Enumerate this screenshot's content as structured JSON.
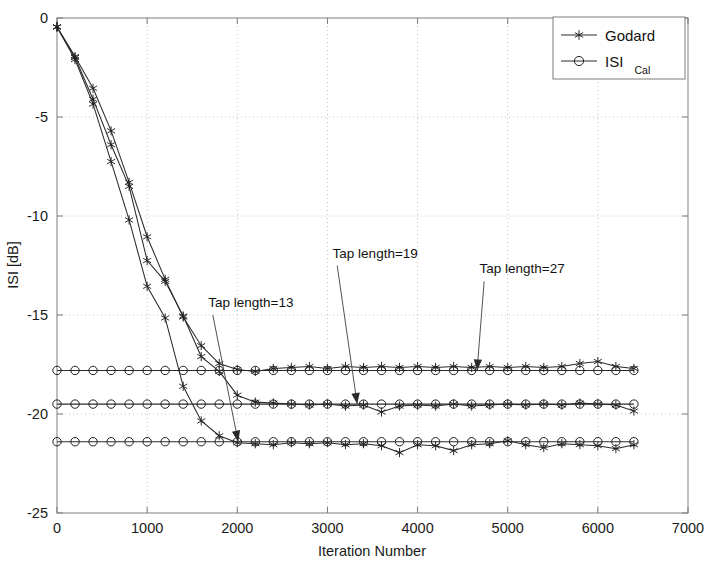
{
  "chart_data": {
    "type": "line",
    "title": "",
    "xlabel": "Iteration Number",
    "ylabel": "ISI [dB]",
    "xlim": [
      0,
      7000
    ],
    "ylim": [
      -25,
      0
    ],
    "xticks": [
      0,
      1000,
      2000,
      3000,
      4000,
      5000,
      6000,
      7000
    ],
    "yticks": [
      0,
      -5,
      -10,
      -15,
      -20,
      -25
    ],
    "xtick_labels": [
      "0",
      "1000",
      "2000",
      "3000",
      "4000",
      "5000",
      "6000",
      "7000"
    ],
    "ytick_labels": [
      "0",
      "-5",
      "-10",
      "-15",
      "-20",
      "-25"
    ],
    "grid": true,
    "grid_style": "dotted",
    "legend": {
      "position": "top-right",
      "entries": [
        {
          "label": "Godard",
          "marker": "star",
          "line": "solid"
        },
        {
          "label": "ISI",
          "sublabel": "Cal",
          "marker": "circle",
          "line": "solid"
        }
      ]
    },
    "annotations": [
      {
        "text": "Tap length=13",
        "text_x": 2150,
        "text_y": -14.6,
        "target_x": 2010,
        "target_y": -21.4
      },
      {
        "text": "Tap length=19",
        "text_x": 3530,
        "text_y": -12.1,
        "target_x": 3330,
        "target_y": -19.5
      },
      {
        "text": "Tap length=27",
        "text_x": 5160,
        "text_y": -12.9,
        "target_x": 4660,
        "target_y": -17.8
      }
    ],
    "marker_interval": 200,
    "series": [
      {
        "name": "Godard, Tap length=13",
        "marker": "star",
        "x": [
          0,
          200,
          400,
          600,
          800,
          1000,
          1200,
          1400,
          1600,
          1800,
          2000,
          2200,
          2400,
          2600,
          2800,
          3000,
          3200,
          3400,
          3600,
          3800,
          4000,
          4200,
          4400,
          4600,
          4800,
          5000,
          5200,
          5400,
          5600,
          5800,
          6000,
          6200,
          6400
        ],
        "values": [
          -0.45,
          -2.1,
          -4.35,
          -7.25,
          -10.2,
          -13.55,
          -15.15,
          -18.6,
          -20.35,
          -21.1,
          -21.45,
          -21.5,
          -21.55,
          -21.45,
          -21.5,
          -21.45,
          -21.55,
          -21.5,
          -21.6,
          -21.95,
          -21.55,
          -21.6,
          -21.85,
          -21.55,
          -21.5,
          -21.35,
          -21.55,
          -21.7,
          -21.5,
          -21.55,
          -21.6,
          -21.75,
          -21.55
        ]
      },
      {
        "name": "Godard, Tap length=19",
        "marker": "star",
        "x": [
          0,
          200,
          400,
          600,
          800,
          1000,
          1200,
          1400,
          1600,
          1800,
          2000,
          2200,
          2400,
          2600,
          2800,
          3000,
          3200,
          3400,
          3600,
          3800,
          4000,
          4200,
          4400,
          4600,
          4800,
          5000,
          5200,
          5400,
          5600,
          5800,
          6000,
          6200,
          6400
        ],
        "values": [
          -0.45,
          -2.0,
          -4.1,
          -6.4,
          -8.5,
          -12.25,
          -13.3,
          -15.05,
          -17.1,
          -17.85,
          -19.05,
          -19.4,
          -19.45,
          -19.5,
          -19.55,
          -19.5,
          -19.6,
          -19.55,
          -19.9,
          -19.6,
          -19.55,
          -19.6,
          -19.5,
          -19.6,
          -19.55,
          -19.5,
          -19.55,
          -19.5,
          -19.55,
          -19.45,
          -19.5,
          -19.55,
          -19.85
        ]
      },
      {
        "name": "Godard, Tap length=27",
        "marker": "star",
        "x": [
          0,
          200,
          400,
          600,
          800,
          1000,
          1200,
          1400,
          1600,
          1800,
          2000,
          2200,
          2400,
          2600,
          2800,
          3000,
          3200,
          3400,
          3600,
          3800,
          4000,
          4200,
          4400,
          4600,
          4800,
          5000,
          5200,
          5400,
          5600,
          5800,
          6000,
          6200,
          6400
        ],
        "values": [
          -0.45,
          -1.95,
          -3.55,
          -5.7,
          -8.3,
          -11.05,
          -13.2,
          -15.1,
          -16.55,
          -17.45,
          -17.75,
          -17.85,
          -17.7,
          -17.65,
          -17.6,
          -17.7,
          -17.6,
          -17.65,
          -17.6,
          -17.65,
          -17.6,
          -17.65,
          -17.6,
          -17.65,
          -17.6,
          -17.65,
          -17.6,
          -17.65,
          -17.6,
          -17.45,
          -17.35,
          -17.6,
          -17.7
        ]
      },
      {
        "name": "ISI Cal, Tap length=13",
        "marker": "circle",
        "x": [
          0,
          200,
          400,
          600,
          800,
          1000,
          1200,
          1400,
          1600,
          1800,
          2000,
          2200,
          2400,
          2600,
          2800,
          3000,
          3200,
          3400,
          3600,
          3800,
          4000,
          4200,
          4400,
          4600,
          4800,
          5000,
          5200,
          5400,
          5600,
          5800,
          6000,
          6200,
          6400
        ],
        "values": [
          -21.4,
          -21.4,
          -21.4,
          -21.4,
          -21.4,
          -21.4,
          -21.4,
          -21.4,
          -21.4,
          -21.4,
          -21.4,
          -21.4,
          -21.4,
          -21.4,
          -21.4,
          -21.4,
          -21.4,
          -21.4,
          -21.4,
          -21.4,
          -21.4,
          -21.4,
          -21.4,
          -21.4,
          -21.4,
          -21.4,
          -21.4,
          -21.4,
          -21.4,
          -21.4,
          -21.4,
          -21.4,
          -21.4
        ]
      },
      {
        "name": "ISI Cal, Tap length=19",
        "marker": "circle",
        "x": [
          0,
          200,
          400,
          600,
          800,
          1000,
          1200,
          1400,
          1600,
          1800,
          2000,
          2200,
          2400,
          2600,
          2800,
          3000,
          3200,
          3400,
          3600,
          3800,
          4000,
          4200,
          4400,
          4600,
          4800,
          5000,
          5200,
          5400,
          5600,
          5800,
          6000,
          6200,
          6400
        ],
        "values": [
          -19.5,
          -19.5,
          -19.5,
          -19.5,
          -19.5,
          -19.5,
          -19.5,
          -19.5,
          -19.5,
          -19.5,
          -19.5,
          -19.5,
          -19.5,
          -19.5,
          -19.5,
          -19.5,
          -19.5,
          -19.5,
          -19.5,
          -19.5,
          -19.5,
          -19.5,
          -19.5,
          -19.5,
          -19.5,
          -19.5,
          -19.5,
          -19.5,
          -19.5,
          -19.5,
          -19.5,
          -19.5,
          -19.5
        ]
      },
      {
        "name": "ISI Cal, Tap length=27",
        "marker": "circle",
        "x": [
          0,
          200,
          400,
          600,
          800,
          1000,
          1200,
          1400,
          1600,
          1800,
          2000,
          2200,
          2400,
          2600,
          2800,
          3000,
          3200,
          3400,
          3600,
          3800,
          4000,
          4200,
          4400,
          4600,
          4800,
          5000,
          5200,
          5400,
          5600,
          5800,
          6000,
          6200,
          6400
        ],
        "values": [
          -17.8,
          -17.8,
          -17.8,
          -17.8,
          -17.8,
          -17.8,
          -17.8,
          -17.8,
          -17.8,
          -17.8,
          -17.8,
          -17.8,
          -17.8,
          -17.8,
          -17.8,
          -17.8,
          -17.8,
          -17.8,
          -17.8,
          -17.8,
          -17.8,
          -17.8,
          -17.8,
          -17.8,
          -17.8,
          -17.8,
          -17.8,
          -17.8,
          -17.8,
          -17.8,
          -17.8,
          -17.8,
          -17.8
        ]
      }
    ]
  },
  "colors": {
    "line": "#2a2a2a",
    "grid": "#b9b9b9",
    "axis": "#8a8a8a",
    "background": "#ffffff"
  }
}
